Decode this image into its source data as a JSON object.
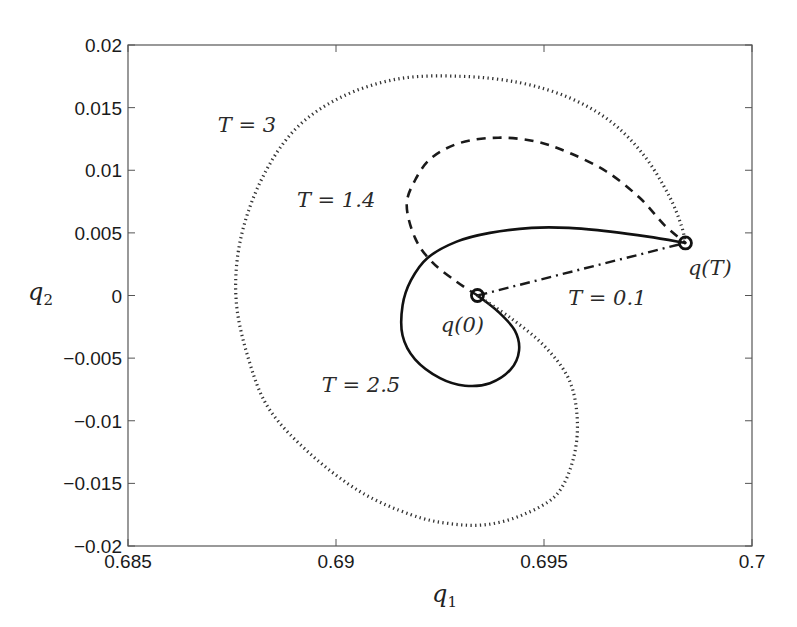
{
  "chart_data": {
    "type": "line",
    "title": "",
    "xlabel": "q1",
    "ylabel": "q2",
    "xlim": [
      0.685,
      0.7
    ],
    "ylim": [
      -0.02,
      0.02
    ],
    "grid": false,
    "legend": "none (inline curve labels)",
    "x_ticks": [
      0.685,
      0.69,
      0.695,
      0.7
    ],
    "x_tick_labels": [
      "0.685",
      "0.69",
      "0.695",
      "0.7"
    ],
    "y_ticks": [
      0.02,
      0.015,
      0.01,
      0.005,
      0,
      -0.005,
      -0.01,
      -0.015,
      -0.02
    ],
    "y_tick_labels": [
      "0.02",
      "0.015",
      "0.01",
      "0.005",
      "0",
      "−0.005",
      "−0.01",
      "−0.015",
      "−0.02"
    ],
    "points": {
      "q0": {
        "label": "q(0)",
        "x": 0.6934,
        "y": 0.0
      },
      "qT": {
        "label": "q(T)",
        "x": 0.6984,
        "y": 0.0042
      }
    },
    "series": [
      {
        "name": "T = 0.1",
        "style": "dashdot",
        "color": "#1a1a1a",
        "x": [
          0.6934,
          0.6984
        ],
        "y": [
          0.0,
          0.0042
        ]
      },
      {
        "name": "T = 1.4",
        "style": "dashed",
        "color": "#1a1a1a",
        "x": [
          0.6934,
          0.6929,
          0.6923,
          0.6919,
          0.6917,
          0.6919,
          0.6923,
          0.693,
          0.6939,
          0.6948,
          0.6956,
          0.6965,
          0.6973,
          0.6979,
          0.6984
        ],
        "y": [
          0.0,
          0.0011,
          0.0027,
          0.0046,
          0.0072,
          0.0092,
          0.011,
          0.0122,
          0.0126,
          0.0123,
          0.0114,
          0.0099,
          0.0078,
          0.0056,
          0.0042
        ]
      },
      {
        "name": "T = 2.5",
        "style": "solid",
        "color": "#111111",
        "x": [
          0.6934,
          0.6939,
          0.6943,
          0.6944,
          0.6942,
          0.6937,
          0.6931,
          0.6925,
          0.6919,
          0.6916,
          0.6916,
          0.6918,
          0.6922,
          0.6929,
          0.6937,
          0.6947,
          0.6956,
          0.6966,
          0.6975,
          0.6984
        ],
        "y": [
          0.0,
          -0.0013,
          -0.0028,
          -0.0044,
          -0.0059,
          -0.007,
          -0.0072,
          -0.0066,
          -0.0051,
          -0.0032,
          -0.0008,
          0.0012,
          0.003,
          0.0043,
          0.005,
          0.0054,
          0.0054,
          0.0051,
          0.0047,
          0.0042
        ]
      },
      {
        "name": "T = 3",
        "style": "dotted",
        "color": "#333333",
        "x": [
          0.6934,
          0.6942,
          0.695,
          0.6956,
          0.6958,
          0.6957,
          0.6953,
          0.6945,
          0.6936,
          0.6927,
          0.6918,
          0.6906,
          0.6894,
          0.6884,
          0.6879,
          0.6876,
          0.6877,
          0.6882,
          0.689,
          0.6901,
          0.6915,
          0.693,
          0.6944,
          0.6956,
          0.6966,
          0.6974,
          0.698,
          0.6983,
          0.6984
        ],
        "y": [
          0.0,
          -0.0018,
          -0.004,
          -0.0067,
          -0.0099,
          -0.0131,
          -0.0159,
          -0.0175,
          -0.0183,
          -0.0182,
          -0.0175,
          -0.0157,
          -0.0127,
          -0.0091,
          -0.0051,
          -0.0004,
          0.0044,
          0.0092,
          0.0132,
          0.0158,
          0.0173,
          0.0175,
          0.017,
          0.0158,
          0.0139,
          0.0112,
          0.008,
          0.0056,
          0.0042
        ]
      }
    ],
    "annotations": [
      {
        "text": "T = 3",
        "x": 0.68716,
        "y": 0.0136
      },
      {
        "text": "T = 1.4",
        "x": 0.68906,
        "y": 0.0076
      },
      {
        "text": "T = 2.5",
        "x": 0.68966,
        "y": -0.00715
      },
      {
        "text": "T = 0.1",
        "x": 0.69558,
        "y": -0.0002
      },
      {
        "text": "q(0)",
        "x": 0.69252,
        "y": -0.00236
      },
      {
        "text": "q(T)",
        "x": 0.69846,
        "y": 0.0022
      }
    ]
  },
  "axes": {
    "xlabel_main": "q",
    "xlabel_sub": "1",
    "ylabel_main": "q",
    "ylabel_sub": "2"
  }
}
